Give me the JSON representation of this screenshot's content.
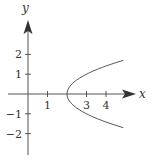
{
  "chart_data": {
    "type": "line",
    "title": "",
    "xlabel": "x",
    "ylabel": "y",
    "xlim": [
      -1,
      5.5
    ],
    "ylim": [
      -3.1,
      3.7
    ],
    "x_ticks": [
      1,
      3,
      4
    ],
    "x_tick_labels": [
      "1",
      "3",
      "4"
    ],
    "y_ticks": [
      -2,
      -1,
      1,
      2
    ],
    "y_tick_labels": [
      "−2",
      "−1",
      "1",
      "2"
    ],
    "grid": false,
    "legend": null,
    "series": [
      {
        "name": "x = y^2 + 2",
        "equation": "x = y^2 + 2",
        "points": [
          {
            "x": 4.89,
            "y": -1.7
          },
          {
            "x": 4.25,
            "y": -1.5
          },
          {
            "x": 3.69,
            "y": -1.3
          },
          {
            "x": 3.21,
            "y": -1.1
          },
          {
            "x": 2.81,
            "y": -0.9
          },
          {
            "x": 2.49,
            "y": -0.7
          },
          {
            "x": 2.25,
            "y": -0.5
          },
          {
            "x": 2.09,
            "y": -0.3
          },
          {
            "x": 2.01,
            "y": -0.1
          },
          {
            "x": 2.0,
            "y": 0
          },
          {
            "x": 2.01,
            "y": 0.1
          },
          {
            "x": 2.09,
            "y": 0.3
          },
          {
            "x": 2.25,
            "y": 0.5
          },
          {
            "x": 2.49,
            "y": 0.7
          },
          {
            "x": 2.81,
            "y": 0.9
          },
          {
            "x": 3.21,
            "y": 1.1
          },
          {
            "x": 3.69,
            "y": 1.3
          },
          {
            "x": 4.25,
            "y": 1.5
          },
          {
            "x": 4.89,
            "y": 1.7
          }
        ]
      }
    ]
  },
  "colors": {
    "axis": "#555555",
    "curve": "#555555",
    "text": "#333333"
  }
}
